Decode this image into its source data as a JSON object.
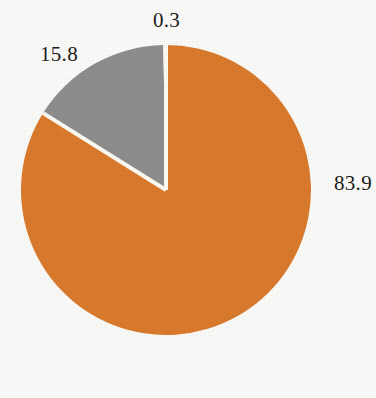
{
  "chart_data": {
    "type": "pie",
    "title": "",
    "subtitle": "",
    "xlabel": "",
    "ylabel": "",
    "legend_position": "none",
    "grid": false,
    "labels_shown": true,
    "categories": [
      "83.9",
      "15.8",
      "0.3"
    ],
    "values": [
      83.9,
      15.8,
      0.3
    ],
    "total": 100.0,
    "start_angle_deg": 0,
    "direction": "clockwise",
    "slices": [
      {
        "value_label": "83.9",
        "value": 83.9,
        "color": "#DD7C2E",
        "color_name": "orange",
        "start_angle_deg": 0.0,
        "end_angle_deg": 302.04,
        "label_position": "right"
      },
      {
        "value_label": "15.8",
        "value": 15.8,
        "color": "#8F8F8F",
        "color_name": "gray",
        "start_angle_deg": 302.04,
        "end_angle_deg": 358.92,
        "label_position": "upper-left"
      },
      {
        "value_label": "0.3",
        "value": 0.3,
        "color": "#FFFFFF",
        "color_name": "white",
        "start_angle_deg": 358.92,
        "end_angle_deg": 360.0,
        "label_position": "top"
      }
    ],
    "geometry": {
      "center_x": 166,
      "center_y": 190,
      "radius": 145,
      "separator_color": "#FFFDF5",
      "separator_width": 4
    },
    "background_color": "#FDFDFB",
    "text_color": "#1D1D1D"
  },
  "labels": {
    "top": "0.3",
    "left": "15.8",
    "right": "83.9"
  }
}
